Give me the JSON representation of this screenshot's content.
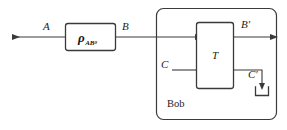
{
  "diagram": {
    "stroke_color": "#3a3a3a",
    "label_color": "#1c1c1c",
    "background": "#ffffff",
    "state_box": {
      "symbol": "ρ",
      "subscript_main": "AB",
      "subscript_sub": "0",
      "name": "rho-AB0-state"
    },
    "operation_box": {
      "label": "T",
      "name": "transformation-T"
    },
    "party_box": {
      "label": "Bob",
      "name": "bob-region"
    },
    "wires": [
      {
        "id": "wire-A",
        "label": "A",
        "direction": "left",
        "name": "output-wire-A"
      },
      {
        "id": "wire-B",
        "label": "B",
        "direction": "right",
        "name": "wire-B"
      },
      {
        "id": "wire-C",
        "label": "C",
        "direction": "right",
        "name": "input-wire-C"
      },
      {
        "id": "wire-Bprime",
        "label": "B′",
        "direction": "right",
        "name": "output-wire-B-prime"
      },
      {
        "id": "wire-Cprime",
        "label": "C′",
        "direction": "down",
        "name": "discarded-wire-C-prime"
      }
    ],
    "discard_symbol": {
      "name": "partial-trace-discard-symbol",
      "shape": "u-bracket-with-down-arrow"
    }
  }
}
